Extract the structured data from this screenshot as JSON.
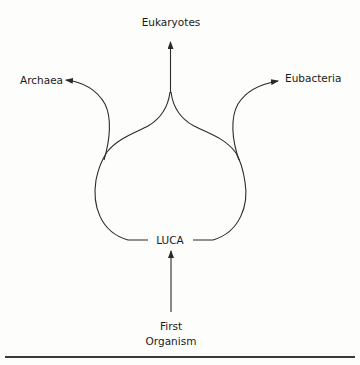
{
  "diagram": {
    "type": "phylogenetic-tree",
    "nodes": {
      "eukaryotes": {
        "label": "Eukaryotes"
      },
      "archaea": {
        "label": "Archaea"
      },
      "eubacteria": {
        "label": "Eubacteria"
      },
      "luca": {
        "label": "LUCA"
      },
      "first_organism": {
        "label_line1": "First",
        "label_line2": "Organism"
      }
    },
    "edges": [
      {
        "from": "First Organism",
        "to": "LUCA"
      },
      {
        "from": "LUCA",
        "to": "Archaea"
      },
      {
        "from": "LUCA",
        "to": "Eukaryotes"
      },
      {
        "from": "LUCA",
        "to": "Eubacteria"
      }
    ],
    "colors": {
      "stroke": "#2a2a2a",
      "text": "#1a1a1a",
      "background": "#fdfdfb",
      "rule": "#3a3a3a"
    }
  }
}
